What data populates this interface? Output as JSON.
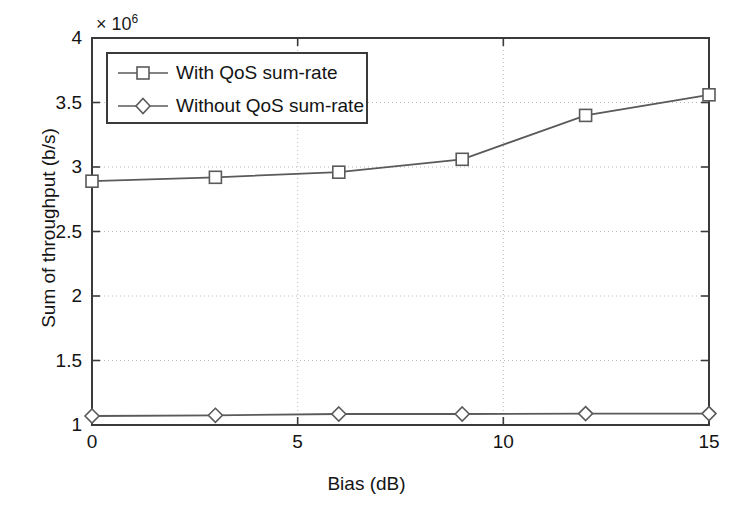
{
  "chart_data": {
    "type": "line",
    "title": "",
    "xlabel": "Bias (dB)",
    "ylabel": "Sum of throughput (b/s)",
    "y_exponent_label": "× 10",
    "y_exponent_power": "6",
    "y_scale_factor": 1000000,
    "xlim": [
      0,
      15
    ],
    "ylim": [
      1,
      4
    ],
    "xticks": [
      0,
      5,
      10,
      15
    ],
    "xticklabels": [
      "0",
      "5",
      "10",
      "15"
    ],
    "yticks": [
      1,
      1.5,
      2,
      2.5,
      3,
      3.5,
      4
    ],
    "yticklabels": [
      "1",
      "1.5",
      "2",
      "2.5",
      "3",
      "3.5",
      "4"
    ],
    "grid": true,
    "grid_style": "dotted",
    "legend_position": "upper left",
    "x": [
      0,
      3,
      6,
      9,
      12,
      15
    ],
    "series": [
      {
        "name": "With QoS sum-rate",
        "marker": "square",
        "color": "#5a5a5a",
        "values": [
          2.89,
          2.92,
          2.96,
          3.06,
          3.4,
          3.56
        ]
      },
      {
        "name": "Without QoS sum-rate",
        "marker": "diamond",
        "color": "#5a5a5a",
        "values": [
          1.07,
          1.075,
          1.085,
          1.085,
          1.088,
          1.088
        ]
      }
    ]
  },
  "legend": {
    "items": [
      {
        "label": "With QoS sum-rate",
        "marker": "square"
      },
      {
        "label": "Without QoS sum-rate",
        "marker": "diamond"
      }
    ]
  },
  "style": {
    "axis_color": "#3a3a3a",
    "line_color": "#5a5a5a",
    "grid_color": "#b9b9b9",
    "background": "#ffffff",
    "text_color": "#141414"
  }
}
